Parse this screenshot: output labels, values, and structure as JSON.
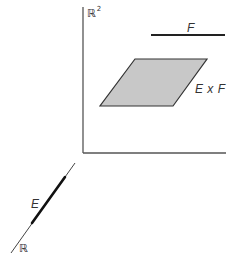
{
  "diagram": {
    "plane": {
      "label": "ℝ",
      "label_superscript": "2",
      "axes": {
        "vertical": {
          "x": 83,
          "y1": 7,
          "y2": 153
        },
        "horizontal": {
          "y": 153,
          "x1": 83,
          "x2": 226
        }
      }
    },
    "set_F": {
      "label": "F",
      "segment": {
        "x1": 151,
        "x2": 225,
        "y": 35
      }
    },
    "product": {
      "label": "E x F",
      "fill_color": "#c8c8c8",
      "vertices": [
        [
          135,
          59
        ],
        [
          207,
          59
        ],
        [
          173,
          106
        ],
        [
          100,
          106
        ]
      ]
    },
    "line": {
      "label": "ℝ",
      "segment": {
        "x1": 75,
        "y1": 163,
        "x2": 11,
        "y2": 253
      }
    },
    "set_E": {
      "label": "E",
      "segment": {
        "x1": 65,
        "y1": 177,
        "x2": 32,
        "y2": 223
      }
    },
    "colors": {
      "stroke": "#333333",
      "axis": "#555555"
    }
  }
}
